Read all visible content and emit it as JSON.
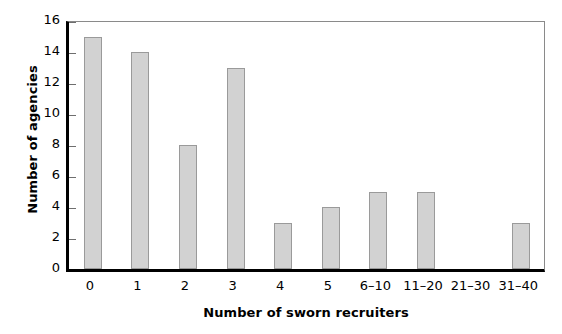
{
  "chart_data": {
    "type": "bar",
    "title": "",
    "xlabel": "Number of sworn recruiters",
    "ylabel": "Number of agencies",
    "categories": [
      "0",
      "1",
      "2",
      "3",
      "4",
      "5",
      "6–10",
      "11–20",
      "21–30",
      "31–40"
    ],
    "values": [
      15,
      14,
      8,
      13,
      3,
      4,
      5,
      5,
      0,
      3
    ],
    "ylim": [
      0,
      16
    ],
    "yticks": [
      0,
      2,
      4,
      6,
      8,
      10,
      12,
      14,
      16
    ],
    "ytick_labels": [
      "0",
      "2",
      "4",
      "6",
      "8",
      "10",
      "12",
      "14",
      "16"
    ],
    "grid": false,
    "legend": false,
    "bar_color": "#d2d2d2",
    "bar_edge_color": "#9a9a9a",
    "axis_color": "#000000",
    "frame_color": "#8a8a8a",
    "background": "#ffffff"
  }
}
